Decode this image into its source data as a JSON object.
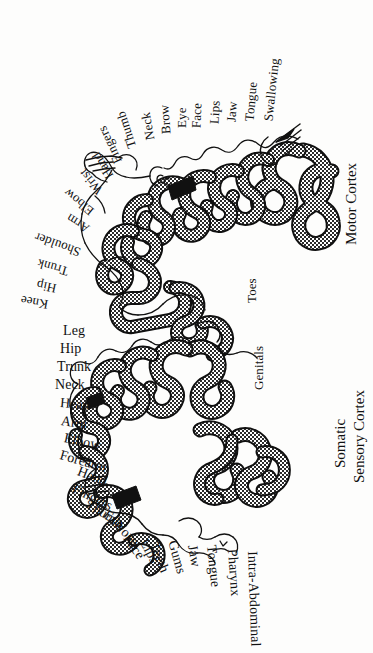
{
  "figure": {
    "background_color": "#fdfdfc",
    "ink_color": "#111111",
    "hatch_color": "#2b2b2b",
    "width": 373,
    "height": 653
  },
  "cortex_titles": {
    "motor": {
      "label": "Motor Cortex",
      "x": 352,
      "y": 245,
      "rotate": -90
    },
    "sensory": {
      "line1": "Somatic",
      "line2": "Sensory Cortex",
      "x1": 341,
      "y1": 468,
      "x2": 360,
      "y2": 483,
      "rotate": -90
    }
  },
  "motor_labels": [
    {
      "text": "Toes",
      "x": 251,
      "y": 303,
      "rotate": -90,
      "size": 13
    },
    {
      "text": "Knee",
      "x": 48,
      "y": 305,
      "rotate": 190,
      "size": 13
    },
    {
      "text": "Hip",
      "x": 56,
      "y": 289,
      "rotate": 192,
      "size": 13
    },
    {
      "text": "Trunk",
      "x": 68,
      "y": 272,
      "rotate": 196,
      "size": 13
    },
    {
      "text": "Shoulder",
      "x": 80,
      "y": 253,
      "rotate": 200,
      "size": 13
    },
    {
      "text": "Arm",
      "x": 88,
      "y": 230,
      "rotate": 212,
      "size": 13
    },
    {
      "text": "Elbow",
      "x": 92,
      "y": 213,
      "rotate": 219,
      "size": 13
    },
    {
      "text": "Wrist",
      "x": 100,
      "y": 193,
      "rotate": 230,
      "size": 13
    },
    {
      "text": "Hand",
      "x": 110,
      "y": 178,
      "rotate": 238,
      "size": 13
    },
    {
      "text": "Fingers",
      "x": 118,
      "y": 163,
      "rotate": 245,
      "size": 13
    },
    {
      "text": "Thumb",
      "x": 132,
      "y": 148,
      "rotate": 252,
      "size": 13
    },
    {
      "text": "Neck",
      "x": 150,
      "y": 140,
      "rotate": 260,
      "size": 13
    },
    {
      "text": "Brow",
      "x": 166,
      "y": 134,
      "rotate": 266,
      "size": 13
    },
    {
      "text": "Eye",
      "x": 181,
      "y": 128,
      "rotate": 270,
      "size": 13
    },
    {
      "text": "Face",
      "x": 196,
      "y": 128,
      "rotate": 272,
      "size": 13
    },
    {
      "text": "Lips",
      "x": 214,
      "y": 124,
      "rotate": 273,
      "size": 13
    },
    {
      "text": "Jaw",
      "x": 231,
      "y": 122,
      "rotate": 274,
      "size": 13
    },
    {
      "text": "Tongue",
      "x": 249,
      "y": 121,
      "rotate": 275,
      "size": 13
    },
    {
      "text": "Swallowing",
      "x": 268,
      "y": 121,
      "rotate": 276,
      "size": 13
    }
  ],
  "sensory_labels": [
    {
      "text": "Genitals",
      "x": 258,
      "y": 390,
      "rotate": -90,
      "size": 13
    },
    {
      "text": "Leg",
      "x": 63,
      "y": 331,
      "rotate": 0,
      "size": 14
    },
    {
      "text": "Hip",
      "x": 60,
      "y": 349,
      "rotate": 0,
      "size": 14
    },
    {
      "text": "Trunk",
      "x": 57,
      "y": 367,
      "rotate": 0,
      "size": 14
    },
    {
      "text": "Neck",
      "x": 55,
      "y": 385,
      "rotate": 0,
      "size": 14
    },
    {
      "text": "Head",
      "x": 60,
      "y": 403,
      "rotate": 5,
      "size": 14
    },
    {
      "text": "Arm",
      "x": 61,
      "y": 421,
      "rotate": 8,
      "size": 14
    },
    {
      "text": "Elbow",
      "x": 64,
      "y": 438,
      "rotate": 12,
      "size": 14
    },
    {
      "text": "Forearm",
      "x": 60,
      "y": 455,
      "rotate": 16,
      "size": 14
    },
    {
      "text": "Hand",
      "x": 78,
      "y": 471,
      "rotate": 21,
      "size": 14
    },
    {
      "text": "Fingers",
      "x": 73,
      "y": 488,
      "rotate": 26,
      "size": 14
    },
    {
      "text": "Thumb",
      "x": 87,
      "y": 503,
      "rotate": 32,
      "size": 14
    },
    {
      "text": "Eye",
      "x": 105,
      "y": 513,
      "rotate": 40,
      "size": 14
    },
    {
      "text": "Nose",
      "x": 116,
      "y": 523,
      "rotate": 46,
      "size": 14
    },
    {
      "text": "Face",
      "x": 126,
      "y": 536,
      "rotate": 55,
      "size": 14
    },
    {
      "text": "Lips",
      "x": 143,
      "y": 540,
      "rotate": 62,
      "size": 14
    },
    {
      "text": "Teeth",
      "x": 153,
      "y": 543,
      "rotate": 68,
      "size": 14
    },
    {
      "text": "Gums",
      "x": 172,
      "y": 541,
      "rotate": 74,
      "size": 14
    },
    {
      "text": "Jaw",
      "x": 192,
      "y": 545,
      "rotate": 80,
      "size": 14
    },
    {
      "text": "Tongue",
      "x": 211,
      "y": 545,
      "rotate": 84,
      "size": 14
    },
    {
      "text": "Pharynx",
      "x": 232,
      "y": 549,
      "rotate": 86,
      "size": 14
    },
    {
      "text": "Intra-Abdominal",
      "x": 252,
      "y": 551,
      "rotate": 88,
      "size": 14
    }
  ],
  "glyphs": [
    {
      "name": "swallowing-throat-glyph",
      "x": 280,
      "y": 127
    }
  ]
}
